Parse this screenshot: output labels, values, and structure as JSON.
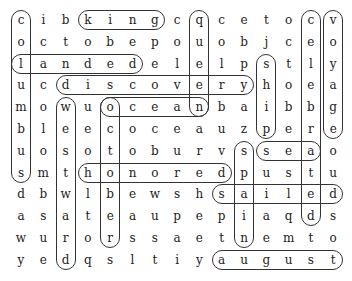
{
  "puzzle": {
    "type": "word-search",
    "rows": 12,
    "cols": 15,
    "grid": [
      "cibkingcqcetocv",
      "octobepouobjceo",
      "landedelelpstly",
      "ucdiscoveryhoea",
      "mowuoceanbaibbg",
      "bleecoceauzpere",
      "uosotoburvsseao",
      "smthonoredpustu",
      "dbwlbewshsailed",
      "asateaupepiaqds",
      "wurorssaetnemto",
      "yedqsltiyaugust"
    ],
    "found_words": [
      {
        "word": "king",
        "dir": "h",
        "row": 0,
        "col": 3,
        "len": 4
      },
      {
        "word": "columbus",
        "dir": "v",
        "row": 0,
        "col": 0,
        "len": 8
      },
      {
        "word": "landed",
        "dir": "h",
        "row": 2,
        "col": 0,
        "len": 6
      },
      {
        "word": "discovery",
        "dir": "h",
        "row": 3,
        "col": 2,
        "len": 9
      },
      {
        "word": "ocean",
        "dir": "h",
        "row": 4,
        "col": 4,
        "len": 5
      },
      {
        "word": "queen",
        "dir": "v",
        "row": 0,
        "col": 8,
        "len": 5
      },
      {
        "word": "voyage",
        "dir": "v",
        "row": 0,
        "col": 14,
        "len": 6
      },
      {
        "word": "celebrated",
        "dir": "v",
        "row": 0,
        "col": 13,
        "len": 10
      },
      {
        "word": "ship",
        "dir": "v",
        "row": 2,
        "col": 11,
        "len": 4
      },
      {
        "word": "october",
        "dir": "v",
        "row": 4,
        "col": 4,
        "len": 7
      },
      {
        "word": "westward",
        "dir": "v",
        "row": 4,
        "col": 2,
        "len": 8
      },
      {
        "word": "honored",
        "dir": "h",
        "row": 7,
        "col": 3,
        "len": 7
      },
      {
        "word": "sea",
        "dir": "h",
        "row": 6,
        "col": 11,
        "len": 3
      },
      {
        "word": "spain",
        "dir": "v",
        "row": 6,
        "col": 10,
        "len": 5
      },
      {
        "word": "sailed",
        "dir": "h",
        "row": 8,
        "col": 9,
        "len": 6
      },
      {
        "word": "august",
        "dir": "h",
        "row": 11,
        "col": 9,
        "len": 6
      }
    ]
  }
}
